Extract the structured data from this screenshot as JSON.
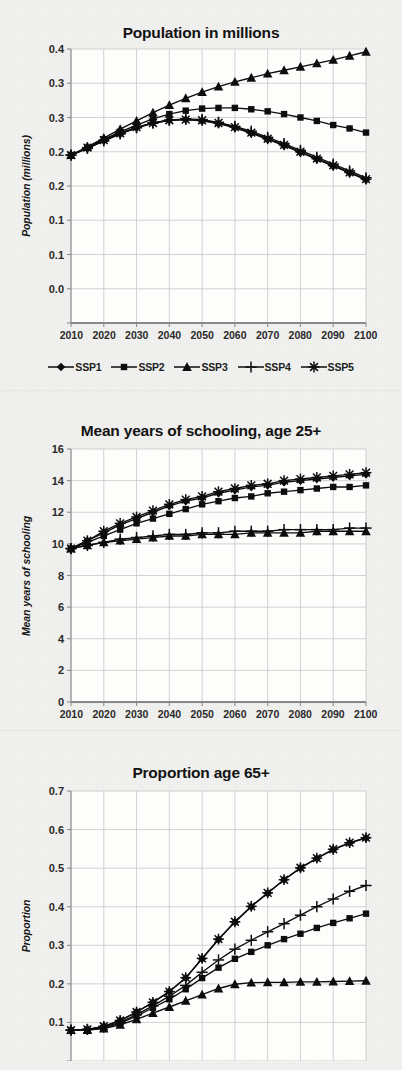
{
  "page": {
    "background_color": "#f1f1ef",
    "ink_color": "#111111",
    "grid_color": "#c9c9c9"
  },
  "legend": {
    "name": "ssp-scenario-legend",
    "items": [
      {
        "label": "SSP1",
        "marker": "diamond"
      },
      {
        "label": "SSP2",
        "marker": "square"
      },
      {
        "label": "SSP3",
        "marker": "triangle"
      },
      {
        "label": "SSP4",
        "marker": "plus"
      },
      {
        "label": "SSP5",
        "marker": "asterisk"
      }
    ]
  },
  "chart_data": [
    {
      "id": "population",
      "type": "line",
      "title": "Population in millions",
      "xlabel": "",
      "ylabel": "Population (millions)",
      "x": [
        2010,
        2015,
        2020,
        2025,
        2030,
        2035,
        2040,
        2045,
        2050,
        2055,
        2060,
        2065,
        2070,
        2075,
        2080,
        2085,
        2090,
        2095,
        2100
      ],
      "xlim": [
        2010,
        2100
      ],
      "xticks": [
        2010,
        2020,
        2030,
        2040,
        2050,
        2060,
        2070,
        2080,
        2090,
        2100
      ],
      "xticklabels": [
        "2010",
        "2020",
        "2030",
        "2040",
        "2050",
        "2060",
        "2070",
        "2080",
        "2090",
        "2100"
      ],
      "ylim": [
        0.0,
        0.4
      ],
      "yticks": [
        0.0,
        0.05,
        0.1,
        0.15,
        0.2,
        0.25,
        0.3,
        0.35,
        0.4
      ],
      "yticklabels": [
        "0.0",
        "0.1",
        "0.1",
        "0.2",
        "0.2",
        "0.3",
        "0.3",
        "0.4"
      ],
      "ytick_display": [
        "0.4",
        "0.3",
        "0.3",
        "0.2",
        "0.2",
        "0.1",
        "0.1",
        "0.0"
      ],
      "grid": true,
      "legend_position": "below",
      "series": [
        {
          "name": "SSP1",
          "marker": "diamond",
          "values": [
            0.245,
            0.255,
            0.266,
            0.276,
            0.285,
            0.292,
            0.296,
            0.297,
            0.295,
            0.291,
            0.285,
            0.277,
            0.268,
            0.259,
            0.249,
            0.239,
            0.229,
            0.219,
            0.209
          ]
        },
        {
          "name": "SSP2",
          "marker": "square",
          "values": [
            0.245,
            0.256,
            0.268,
            0.279,
            0.289,
            0.298,
            0.305,
            0.31,
            0.313,
            0.314,
            0.314,
            0.312,
            0.309,
            0.305,
            0.3,
            0.295,
            0.289,
            0.284,
            0.278
          ]
        },
        {
          "name": "SSP3",
          "marker": "triangle",
          "values": [
            0.245,
            0.257,
            0.27,
            0.283,
            0.295,
            0.307,
            0.318,
            0.328,
            0.337,
            0.345,
            0.352,
            0.358,
            0.364,
            0.369,
            0.374,
            0.379,
            0.384,
            0.39,
            0.396
          ]
        },
        {
          "name": "SSP4",
          "marker": "plus",
          "values": [
            0.245,
            0.255,
            0.266,
            0.276,
            0.285,
            0.292,
            0.296,
            0.298,
            0.297,
            0.293,
            0.287,
            0.28,
            0.271,
            0.262,
            0.252,
            0.242,
            0.232,
            0.222,
            0.212
          ]
        },
        {
          "name": "SSP5",
          "marker": "asterisk",
          "values": [
            0.245,
            0.256,
            0.267,
            0.277,
            0.286,
            0.292,
            0.296,
            0.297,
            0.296,
            0.292,
            0.286,
            0.278,
            0.269,
            0.26,
            0.25,
            0.24,
            0.23,
            0.22,
            0.21
          ]
        }
      ]
    },
    {
      "id": "schooling",
      "type": "line",
      "title": "Mean years of schooling, age 25+",
      "xlabel": "",
      "ylabel": "Mean years of schooling",
      "x": [
        2010,
        2015,
        2020,
        2025,
        2030,
        2035,
        2040,
        2045,
        2050,
        2055,
        2060,
        2065,
        2070,
        2075,
        2080,
        2085,
        2090,
        2095,
        2100
      ],
      "xlim": [
        2010,
        2100
      ],
      "xticks": [
        2010,
        2020,
        2030,
        2040,
        2050,
        2060,
        2070,
        2080,
        2090,
        2100
      ],
      "xticklabels": [
        "2010",
        "2020",
        "2030",
        "2040",
        "2050",
        "2060",
        "2070",
        "2080",
        "2090",
        "2100"
      ],
      "ylim": [
        0,
        16
      ],
      "yticks": [
        0,
        2,
        4,
        6,
        8,
        10,
        12,
        14,
        16
      ],
      "ytick_display": [
        "16",
        "14",
        "12",
        "10",
        "8",
        "6",
        "4",
        "2",
        "0"
      ],
      "grid": true,
      "legend_position": "none",
      "series": [
        {
          "name": "SSP1",
          "marker": "diamond",
          "values": [
            9.7,
            10.2,
            10.7,
            11.2,
            11.6,
            12.0,
            12.4,
            12.7,
            12.9,
            13.2,
            13.4,
            13.6,
            13.7,
            13.9,
            14.0,
            14.1,
            14.2,
            14.3,
            14.4
          ]
        },
        {
          "name": "SSP2",
          "marker": "square",
          "values": [
            9.7,
            10.1,
            10.5,
            10.9,
            11.3,
            11.6,
            11.9,
            12.2,
            12.5,
            12.7,
            12.9,
            13.0,
            13.2,
            13.3,
            13.4,
            13.5,
            13.6,
            13.6,
            13.7
          ]
        },
        {
          "name": "SSP3",
          "marker": "triangle",
          "values": [
            9.7,
            9.9,
            10.1,
            10.2,
            10.3,
            10.4,
            10.5,
            10.5,
            10.6,
            10.6,
            10.6,
            10.7,
            10.7,
            10.7,
            10.7,
            10.8,
            10.8,
            10.8,
            10.8
          ]
        },
        {
          "name": "SSP4",
          "marker": "plus",
          "values": [
            9.7,
            9.9,
            10.1,
            10.3,
            10.4,
            10.5,
            10.6,
            10.6,
            10.7,
            10.7,
            10.8,
            10.8,
            10.8,
            10.9,
            10.9,
            10.9,
            10.9,
            11.0,
            11.0
          ]
        },
        {
          "name": "SSP5",
          "marker": "asterisk",
          "values": [
            9.7,
            10.2,
            10.8,
            11.3,
            11.7,
            12.1,
            12.5,
            12.8,
            13.0,
            13.3,
            13.5,
            13.7,
            13.8,
            14.0,
            14.1,
            14.2,
            14.3,
            14.4,
            14.5
          ]
        }
      ]
    },
    {
      "id": "proportion65",
      "type": "line",
      "title": "Proportion age 65+",
      "xlabel": "",
      "ylabel": "Proportion",
      "x": [
        2010,
        2015,
        2020,
        2025,
        2030,
        2035,
        2040,
        2045,
        2050,
        2055,
        2060,
        2065,
        2070,
        2075,
        2080,
        2085,
        2090,
        2095,
        2100
      ],
      "xlim": [
        2010,
        2100
      ],
      "xticks": [
        2010,
        2020,
        2030,
        2040,
        2050,
        2060,
        2070,
        2080,
        2090,
        2100
      ],
      "xticklabels": [
        "2010",
        "2020",
        "2030",
        "2040",
        "2050",
        "2060",
        "2070",
        "2080",
        "2090",
        "2100"
      ],
      "ylim": [
        0.0,
        0.7
      ],
      "yticks": [
        0.0,
        0.1,
        0.2,
        0.3,
        0.4,
        0.5,
        0.6,
        0.7
      ],
      "ytick_display": [
        "0.7",
        "0.6",
        "0.5",
        "0.4",
        "0.3",
        "0.2",
        "0.1"
      ],
      "grid": true,
      "legend_position": "none",
      "clipped_bottom": true,
      "series": [
        {
          "name": "SSP1",
          "marker": "diamond",
          "values": [
            0.08,
            0.082,
            0.09,
            0.105,
            0.127,
            0.152,
            0.18,
            0.215,
            0.265,
            0.315,
            0.36,
            0.4,
            0.435,
            0.47,
            0.5,
            0.525,
            0.548,
            0.565,
            0.578
          ]
        },
        {
          "name": "SSP2",
          "marker": "square",
          "values": [
            0.08,
            0.081,
            0.086,
            0.098,
            0.116,
            0.138,
            0.16,
            0.186,
            0.215,
            0.242,
            0.265,
            0.283,
            0.3,
            0.316,
            0.33,
            0.345,
            0.358,
            0.37,
            0.382
          ]
        },
        {
          "name": "SSP3",
          "marker": "triangle",
          "values": [
            0.08,
            0.08,
            0.084,
            0.094,
            0.108,
            0.124,
            0.14,
            0.156,
            0.172,
            0.188,
            0.199,
            0.203,
            0.204,
            0.204,
            0.205,
            0.205,
            0.206,
            0.207,
            0.208
          ]
        },
        {
          "name": "SSP4",
          "marker": "plus",
          "values": [
            0.08,
            0.082,
            0.088,
            0.101,
            0.12,
            0.143,
            0.168,
            0.196,
            0.23,
            0.262,
            0.29,
            0.313,
            0.335,
            0.356,
            0.378,
            0.4,
            0.42,
            0.44,
            0.455
          ]
        },
        {
          "name": "SSP5",
          "marker": "asterisk",
          "values": [
            0.08,
            0.082,
            0.09,
            0.105,
            0.127,
            0.152,
            0.18,
            0.216,
            0.266,
            0.316,
            0.361,
            0.401,
            0.436,
            0.47,
            0.501,
            0.526,
            0.549,
            0.566,
            0.579
          ]
        }
      ]
    }
  ]
}
